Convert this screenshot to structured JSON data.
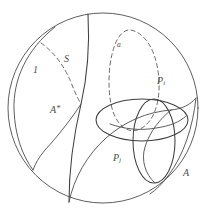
{
  "figure": {
    "kind": "mathematical-topology-diagram",
    "background_color": "#ffffff",
    "stroke_color": "#4a4a4a",
    "dash_color": "#5a5a5a",
    "label_color": "#4d4d4d",
    "canvas": {
      "width": 208,
      "height": 216
    },
    "boundary_circle": {
      "cx": 103,
      "cy": 108,
      "r": 95
    }
  },
  "labels": {
    "region_one": "1",
    "surface_S": "S",
    "curve_a": "a",
    "a_star": "A",
    "a_star_sup": "*",
    "p_i": "P",
    "p_i_sub": "i",
    "p_j": "P",
    "p_j_sub": "j",
    "annulus_a": "A"
  },
  "curves": {
    "boundary": "outer-boundary-circle",
    "left_arc": "left-meridian-arc",
    "spine_arc": "central-vertical-arc",
    "dashed_S": "dashed-arc-S",
    "dashed_loop_a": "dashed-loop-a",
    "lower_arc": "lower-sweep-arc",
    "horizontal_oval": "horizontal-oval",
    "vertical_oval": "vertical-oval",
    "right_arc": "right-sweep-arc",
    "inner_lens": "inner-lens-arc"
  }
}
